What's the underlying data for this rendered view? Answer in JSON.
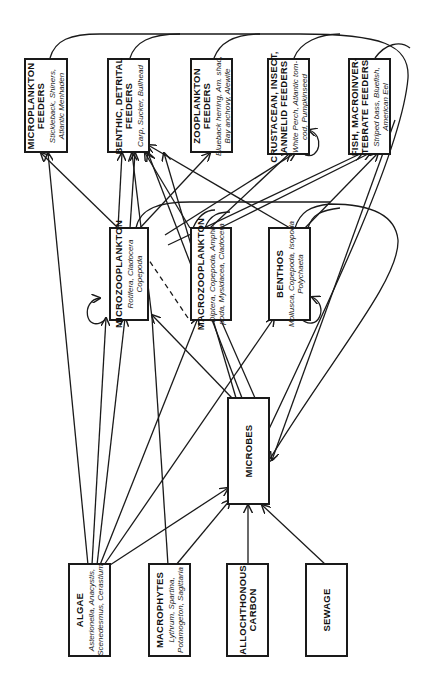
{
  "diagram": {
    "title": "",
    "orientation": "rotated-90",
    "nodes": [
      {
        "id": "microplankton_feeders",
        "title_line1": "MICROPLANKTON",
        "title_line2": "FEEDERS",
        "examples_line1": "Stickleback, Shiners,",
        "examples_line2": "Atlantic Menhaden"
      },
      {
        "id": "benthic_detrital_feeders",
        "title_line1": "BENTHIC, DETRITAL",
        "title_line2": "FEEDERS",
        "examples_line1": "Carp, Sucker, Bullhead",
        "examples_line2": ""
      },
      {
        "id": "zooplankton_feeders",
        "title_line1": "ZOOPLANKTON",
        "title_line2": "FEEDERS",
        "examples_line1": "Blueback herring, Am. shad,",
        "examples_line2": "Bay anchovy, Alewife"
      },
      {
        "id": "crustacean_feeders",
        "title_line1": "CRUSTACEAN, INSECT,",
        "title_line2": "ANNELID FEEDERS",
        "examples_line1": "White Perch, Atlantic tom-",
        "examples_line2": "cod, Pumpkinseed"
      },
      {
        "id": "fish_macroinvertebrate_feeders",
        "title_line1": "FISH, MACROINVER-",
        "title_line2": "TEBRATE FEEDERS",
        "examples_line1": "Striped bass, Bluefish,",
        "examples_line2": "American Eel"
      },
      {
        "id": "microzooplankton",
        "title_line1": "MICROZOOPLANKTON",
        "title_line2": "",
        "examples_line1": "Rotifera, Cladocera",
        "examples_line2": "Copepoda"
      },
      {
        "id": "macrozooplankton",
        "title_line1": "MACROZOOPLANKTON",
        "title_line2": "",
        "examples_line1": "Diptera, Copepoda, Amphi-",
        "examples_line2": "poda, Mysidacea, Cladocera"
      },
      {
        "id": "benthos",
        "title_line1": "BENTHOS",
        "title_line2": "",
        "examples_line1": "Mollusca, Copepoda, Isopoda",
        "examples_line2": "Polychaeta"
      },
      {
        "id": "microbes",
        "title_line1": "MICROBES",
        "title_line2": "",
        "examples_line1": "",
        "examples_line2": ""
      },
      {
        "id": "algae",
        "title_line1": "ALGAE",
        "title_line2": "",
        "examples_line1": "Asterionella, Anacystis,",
        "examples_line2": "Scenedesmus, Cerastium"
      },
      {
        "id": "macrophytes",
        "title_line1": "MACROPHYTES",
        "title_line2": "",
        "examples_line1": "Lythrum, Spartina,",
        "examples_line2": "Potamogeton, Sagittaria"
      },
      {
        "id": "allochthonous_carbon",
        "title_line1": "ALLOCHTHONOUS",
        "title_line2": "CARBON",
        "examples_line1": "",
        "examples_line2": ""
      },
      {
        "id": "sewage",
        "title_line1": "SEWAGE",
        "title_line2": "",
        "examples_line1": "",
        "examples_line2": ""
      }
    ],
    "edges": [
      {
        "from": "algae",
        "to": "microplankton_feeders"
      },
      {
        "from": "algae",
        "to": "microzooplankton"
      },
      {
        "from": "algae",
        "to": "macrozooplankton"
      },
      {
        "from": "algae",
        "to": "benthos"
      },
      {
        "from": "algae",
        "to": "microbes"
      },
      {
        "from": "algae",
        "to": "benthic_detrital_feeders"
      },
      {
        "from": "macrophytes",
        "to": "benthic_detrital_feeders"
      },
      {
        "from": "macrophytes",
        "to": "microbes"
      },
      {
        "from": "allochthonous_carbon",
        "to": "microbes"
      },
      {
        "from": "sewage",
        "to": "microbes"
      },
      {
        "from": "microbes",
        "to": "microzooplankton"
      },
      {
        "from": "microbes",
        "to": "macrozooplankton"
      },
      {
        "from": "microbes",
        "to": "benthic_detrital_feeders"
      },
      {
        "from": "microzooplankton",
        "to": "microplankton_feeders"
      },
      {
        "from": "microzooplankton",
        "to": "benthic_detrital_feeders"
      },
      {
        "from": "microzooplankton",
        "to": "zooplankton_feeders"
      },
      {
        "from": "microzooplankton",
        "to": "crustacean_feeders"
      },
      {
        "from": "microzooplankton",
        "to": "fish_macroinvertebrate_feeders"
      },
      {
        "from": "microzooplankton",
        "to": "microzooplankton",
        "type": "self-loop"
      },
      {
        "from": "macrozooplankton",
        "to": "crustacean_feeders"
      },
      {
        "from": "macrozooplankton",
        "to": "fish_macroinvertebrate_feeders"
      },
      {
        "from": "macrozooplankton",
        "to": "microzooplankton",
        "type": "dashed"
      },
      {
        "from": "benthos",
        "to": "crustacean_feeders"
      },
      {
        "from": "benthos",
        "to": "fish_macroinvertebrate_feeders"
      },
      {
        "from": "benthos",
        "to": "benthos",
        "type": "self-loop"
      },
      {
        "from": "crustacean_feeders",
        "to": "crustacean_feeders",
        "type": "self-loop"
      },
      {
        "from": "microplankton_feeders",
        "to": "microbes",
        "type": "return-curve"
      },
      {
        "from": "benthic_detrital_feeders",
        "to": "microbes",
        "type": "return-curve"
      },
      {
        "from": "zooplankton_feeders",
        "to": "microbes",
        "type": "return-curve"
      },
      {
        "from": "crustacean_feeders",
        "to": "microbes",
        "type": "return-curve"
      },
      {
        "from": "fish_macroinvertebrate_feeders",
        "to": "microbes",
        "type": "return-curve"
      },
      {
        "from": "microzooplankton",
        "to": "microbes",
        "type": "return-curve"
      },
      {
        "from": "macrozooplankton",
        "to": "microbes",
        "type": "return-curve"
      },
      {
        "from": "benthos",
        "to": "microbes",
        "type": "return-curve"
      }
    ]
  },
  "colors": {
    "line": "#1a1a1a",
    "background": "#ffffff"
  }
}
